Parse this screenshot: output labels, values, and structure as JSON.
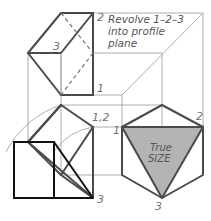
{
  "figure": {
    "annotation": {
      "line1": "Revolve 1–2–3",
      "line2": "into profile",
      "line3": "plane"
    },
    "labels": {
      "top_view_2": "2",
      "top_view_3": "3",
      "top_view_1": "1",
      "front_view_12": "1,2",
      "front_view_1": "1",
      "front_view_3": "3",
      "side_view_1": "1",
      "side_view_2": "2",
      "side_view_3": "3"
    },
    "true_size": {
      "line1": "True",
      "line2": "SIZE"
    },
    "colors": {
      "object_line": "#4a4a4a",
      "construction_line": "#9a9a9a",
      "hidden_line": "#6a6a6a",
      "true_size_fill": "#b4b4b4",
      "revolved_outline": "#111111"
    }
  }
}
